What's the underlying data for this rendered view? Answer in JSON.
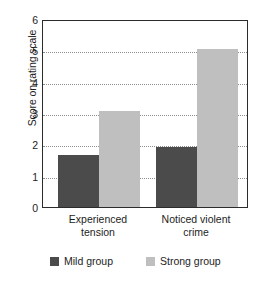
{
  "chart_data": {
    "type": "bar",
    "title": "",
    "xlabel": "",
    "ylabel": "Score on rating scale",
    "ylim": [
      0,
      6
    ],
    "yticks": [
      0,
      1,
      2,
      3,
      4,
      5,
      6
    ],
    "ytick_labels": [
      "0",
      "1",
      "2",
      "3",
      "4",
      "5",
      "6"
    ],
    "grid": "horizontal-dotted",
    "legend_position": "bottom",
    "categories": [
      "Experienced tension",
      "Noticed violent crime"
    ],
    "category_lines": [
      [
        "Experienced",
        "tension"
      ],
      [
        "Noticed violent",
        "crime"
      ]
    ],
    "series": [
      {
        "name": "Mild group",
        "color": "#4b4b4b",
        "values": [
          1.65,
          1.9
        ]
      },
      {
        "name": "Strong group",
        "color": "#bfbfbf",
        "values": [
          3.05,
          5.05
        ]
      }
    ]
  },
  "legend": {
    "items": [
      {
        "label": "Mild group",
        "swatch": "mild"
      },
      {
        "label": "Strong group",
        "swatch": "strong"
      }
    ]
  },
  "colors": {
    "mild": "#4b4b4b",
    "strong": "#bfbfbf",
    "axis": "#2b2b2b",
    "grid": "#8d8d8d",
    "text": "#1d1d1d",
    "background": "#ffffff"
  }
}
